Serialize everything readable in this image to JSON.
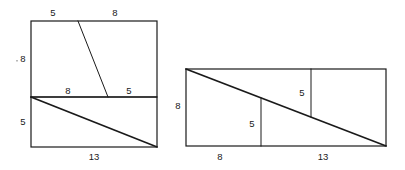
{
  "figure": {
    "type": "geometric-diagram",
    "background_color": "#ffffff",
    "stroke_color": "#1a1a1a",
    "label_color": "#1a1a1a",
    "left_figure": {
      "name": "stacked-arrangement",
      "outer_rect": {
        "x": 31,
        "y": 21,
        "width": 126,
        "height": 126
      },
      "divider_y": 97,
      "labels": {
        "top_left": "5",
        "top_right": "8",
        "left_upper": "8",
        "left_lower": "5",
        "middle_left": "8",
        "middle_right": "5",
        "bottom": "13"
      }
    },
    "right_figure": {
      "name": "stepped-arrangement",
      "outer_rect": {
        "x": 186,
        "y": 69,
        "width": 200,
        "height": 77
      },
      "labels": {
        "left": "8",
        "inner_lower": "5",
        "inner_upper": "5",
        "bottom_left": "8",
        "bottom_right": "13"
      }
    }
  }
}
